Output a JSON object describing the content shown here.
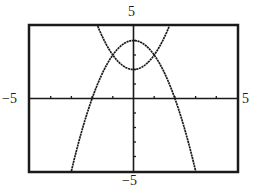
{
  "chart_data": {
    "type": "line",
    "title": "",
    "xlabel": "",
    "ylabel": "",
    "xlim": [
      -5,
      5
    ],
    "ylim": [
      -5,
      5
    ],
    "tick_labels": {
      "xmin": "−5",
      "xmax": "5",
      "ymin": "−5",
      "ymax": "5"
    },
    "x_tick_step": 1,
    "y_tick_step": 1,
    "grid": false,
    "legend": null,
    "series": [
      {
        "name": "y = x^2 + 2",
        "equation": "x^2 + 2",
        "a": 1,
        "c": 2,
        "domain": [
          -1.73,
          1.73
        ],
        "vertex": [
          0,
          2
        ]
      },
      {
        "name": "y = 4 - x^2",
        "equation": "4 - x^2",
        "a": -1,
        "c": 4,
        "domain": [
          -3,
          3
        ],
        "vertex": [
          0,
          4
        ],
        "x_intercepts": [
          -2,
          2
        ]
      }
    ],
    "intersections": [
      [
        -1,
        3
      ],
      [
        1,
        3
      ]
    ]
  },
  "colors": {
    "ink": "#1a1a1a",
    "background": "#ffffff"
  }
}
